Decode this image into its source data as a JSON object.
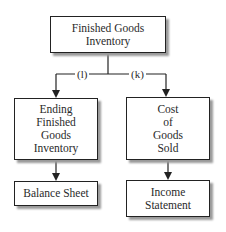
{
  "diagram": {
    "nodes": {
      "finished_goods_inventory": "Finished Goods\nInventory",
      "ending_finished_goods_inventory": "Ending\nFinished\nGoods\nInventory",
      "cost_of_goods_sold": "Cost\nof\nGoods\nSold",
      "balance_sheet": "Balance Sheet",
      "income_statement": "Income\nStatement"
    },
    "edge_labels": {
      "left": "(l)",
      "right": "(k)"
    },
    "colors": {
      "line": "#222222",
      "shadow": "#9a9a9a"
    }
  }
}
